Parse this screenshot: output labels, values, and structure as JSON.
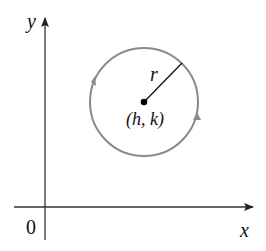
{
  "diagram": {
    "axes": {
      "x_label": "x",
      "y_label": "y",
      "origin_label": "0"
    },
    "circle": {
      "center_label": "(h, k)",
      "radius_label": "r",
      "stroke_color": "#8a8a8a",
      "direction": "counterclockwise"
    },
    "colors": {
      "axis": "#222222",
      "circle": "#8a8a8a",
      "text": "#111111"
    }
  }
}
